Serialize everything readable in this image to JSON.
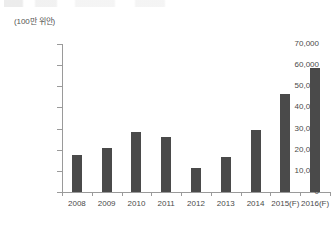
{
  "unit_label": "(100만 위안)",
  "chart_data": {
    "type": "bar",
    "title": "",
    "subtitle": "",
    "xlabel": "",
    "ylabel": "(100만 위안)",
    "ylim": [
      0,
      70000
    ],
    "ytick_values": [
      0,
      10000,
      20000,
      30000,
      40000,
      50000,
      60000,
      70000
    ],
    "ytick_labels": [
      "0",
      "10,000",
      "20,000",
      "30,000",
      "40,000",
      "50,000",
      "60,000",
      "70,000"
    ],
    "grid": false,
    "legend": "none",
    "bar_color": "#4a4a4a",
    "axis_color": "#9a9a9a",
    "categories": [
      "2008",
      "2009",
      "2010",
      "2011",
      "2012",
      "2013",
      "2014",
      "2015(F)",
      "2016(F)"
    ],
    "values": [
      17500,
      21000,
      28500,
      26000,
      11500,
      16500,
      29500,
      46500,
      58500
    ],
    "series": [
      {
        "name": "",
        "values": [
          17500,
          21000,
          28500,
          26000,
          11500,
          16500,
          29500,
          46500,
          58500
        ]
      }
    ],
    "annotations": []
  }
}
